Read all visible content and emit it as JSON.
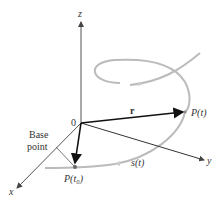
{
  "diagram": {
    "axes": {
      "z_label": "z",
      "x_label": "x",
      "y_label": "y",
      "origin_label": "0"
    },
    "vector_label": "r",
    "point_label": "P(t)",
    "base_point_label": "P(t₀)",
    "base_point_text_line1": "Base",
    "base_point_text_line2": "point",
    "arc_length_label": "s(t)",
    "colors": {
      "axis": "#555555",
      "vector": "#222222",
      "curve": "#bbbbbb",
      "text": "#333333"
    }
  }
}
